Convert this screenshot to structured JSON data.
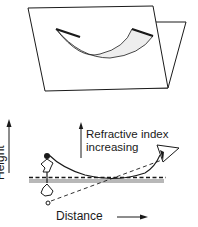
{
  "figure": {
    "type": "mirage refraction diagram",
    "top_panel": {
      "description": "Curved sheet (light path surface) lying between two intersecting planes"
    },
    "bottom_panel": {
      "labels": {
        "refractive_line1": "Refractive index",
        "refractive_line2": "increasing",
        "x_axis": "Distance",
        "y_axis": "Height"
      },
      "elements": [
        "object (palm tree)",
        "inverted image",
        "ground surface",
        "observer eye",
        "curved light ray",
        "dashed line of sight"
      ]
    },
    "colors": {
      "ink": "#1a1a1a",
      "ground_hatch": "#888888",
      "background": "#ffffff"
    }
  }
}
